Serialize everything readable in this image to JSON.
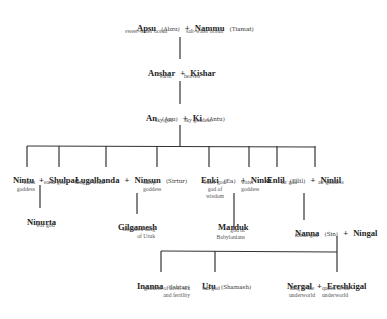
{
  "diagram": {
    "type": "family-tree",
    "generations": [
      {
        "couple": [
          {
            "name": "Apsu",
            "alt": "(Abzu)",
            "desc": "sweet-water ocean"
          },
          {
            "name": "Nammu",
            "alt": "(Tiamat)",
            "desc": "salt-water ocean"
          }
        ]
      },
      {
        "couple": [
          {
            "name": "Anshar",
            "alt": "",
            "desc": "earth"
          },
          {
            "name": "Kishar",
            "alt": "",
            "desc": "heaven"
          }
        ]
      },
      {
        "couple": [
          {
            "name": "An",
            "alt": "(Anu)",
            "desc": "sky god"
          },
          {
            "name": "Ki",
            "alt": "(Antu)",
            "desc": "sky goddess"
          }
        ]
      }
    ],
    "children_of_an_ki": [
      {
        "couple": [
          {
            "name": "Nintu",
            "desc_lines": [
              "earth",
              "goddess"
            ]
          },
          {
            "name": "Shulpae",
            "desc_lines": [
              "earth god"
            ]
          }
        ],
        "child": {
          "name": "Ninurta",
          "desc_lines": [
            "war god"
          ]
        }
      },
      {
        "couple": [
          {
            "name": "Lugalbanda",
            "desc_lines": [
              "king of Uruk"
            ]
          },
          {
            "name": "Ninsun",
            "alt": "(Sirtur)",
            "desc_lines": [
              "sheep",
              "goddess"
            ]
          }
        ],
        "child": {
          "name": "Gilgamesh",
          "desc_lines": [
            "shepherd-king",
            "of Uruk"
          ]
        }
      },
      {
        "couple": [
          {
            "name": "Enki",
            "alt": "(Ea)",
            "desc_lines": [
              "water god/",
              "god of",
              "wisdom"
            ]
          },
          {
            "name": "Ninki",
            "desc_lines": [
              "water",
              "goddess"
            ]
          }
        ],
        "child": {
          "name": "Marduk",
          "desc_lines": [
            "god of",
            "Babylonians"
          ]
        }
      },
      {
        "couple": [
          {
            "name": "Enlil",
            "alt": "(Ellil)",
            "desc_lines": [
              "air god"
            ]
          },
          {
            "name": "Ninlil",
            "desc_lines": [
              "air goddess"
            ]
          }
        ],
        "child": {
          "couple": [
            {
              "name": "Nanna",
              "alt": "(Sin)",
              "desc_lines": [
                "moon god"
              ]
            },
            {
              "name": "Ningal",
              "desc_lines": []
            }
          ]
        }
      }
    ],
    "children_of_nanna_ningal": [
      {
        "name": "Inanna",
        "alt": "(Ishtar)",
        "desc_lines": [
          "goddess of love, sex",
          "and fertility"
        ]
      },
      {
        "name": "Utu",
        "alt": "(Shamash)",
        "desc_lines": [
          "sun god"
        ]
      },
      {
        "couple": [
          {
            "name": "Nergal",
            "desc_lines": [
              "king of the",
              "underworld"
            ]
          },
          {
            "name": "Ereshkigal",
            "desc_lines": [
              "queen of the",
              "underworld"
            ]
          }
        ]
      }
    ],
    "plus": "+",
    "colors": {
      "line": "#333333",
      "name": "#1e1e1e",
      "desc": "#555555",
      "background": "#ffffff"
    }
  }
}
